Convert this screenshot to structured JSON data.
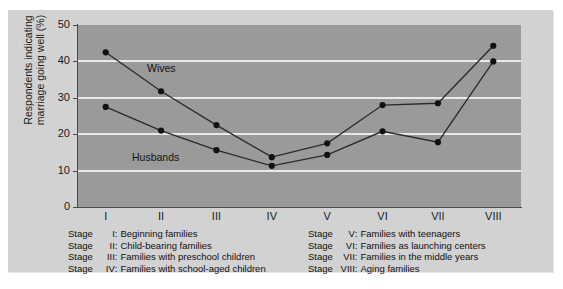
{
  "chart_data": {
    "type": "line",
    "title": "",
    "xlabel": "",
    "ylabel": "Respondents indicating marriage going well (%)",
    "categories": [
      "I",
      "II",
      "III",
      "IV",
      "V",
      "VI",
      "VII",
      "VIII"
    ],
    "x_tick_labels": [
      "I",
      "II",
      "III",
      "IV",
      "V",
      "VI",
      "VII",
      "VIII"
    ],
    "y_tick_labels": [
      "50",
      "40",
      "30",
      "20",
      "10",
      "0"
    ],
    "ylim": [
      0,
      50
    ],
    "y_tick_step": 10,
    "grid": "horizontal",
    "legend_position": "inline-annotation",
    "series": [
      {
        "name": "Wives",
        "values": [
          42.5,
          31.8,
          22.5,
          13.7,
          17.5,
          28.0,
          28.5,
          44.3
        ]
      },
      {
        "name": "Husbands",
        "values": [
          27.5,
          21.0,
          15.6,
          11.3,
          14.3,
          20.8,
          17.8,
          40.0
        ]
      }
    ],
    "annotations": [
      {
        "text": "Wives",
        "series": "Wives"
      },
      {
        "text": "Husbands",
        "series": "Husbands"
      }
    ],
    "colors": {
      "plot_background": "#9a9a9a",
      "card_background": "#d2d2d2",
      "gridline": "#e9e9e9",
      "line": "#2a2a2a",
      "marker": "#111111",
      "axis": "#4a4a4a",
      "text": "#111111"
    }
  },
  "legend": {
    "left_column": [
      {
        "stage_word": "Stage",
        "numeral": "I",
        "colon": ":",
        "description": "Beginning families"
      },
      {
        "stage_word": "Stage",
        "numeral": "II",
        "colon": ":",
        "description": "Child-bearing families"
      },
      {
        "stage_word": "Stage",
        "numeral": "III",
        "colon": ":",
        "description": "Families with preschool children"
      },
      {
        "stage_word": "Stage",
        "numeral": "IV",
        "colon": ":",
        "description": "Families with school-aged children"
      }
    ],
    "right_column": [
      {
        "stage_word": "Stage",
        "numeral": "V",
        "colon": ":",
        "description": "Families with teenagers"
      },
      {
        "stage_word": "Stage",
        "numeral": "VI",
        "colon": ":",
        "description": "Families as launching centers"
      },
      {
        "stage_word": "Stage",
        "numeral": "VII",
        "colon": ":",
        "description": "Families in the middle years"
      },
      {
        "stage_word": "Stage",
        "numeral": "VIII",
        "colon": ":",
        "description": "Aging families"
      }
    ]
  }
}
